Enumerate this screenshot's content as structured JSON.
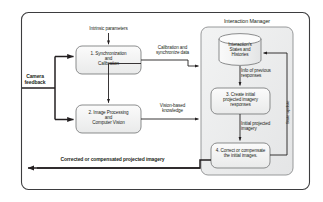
{
  "diagram": {
    "outer_frame": {
      "name": "system-boundary"
    },
    "panel": {
      "title": "Interaction Manager"
    },
    "nodes": [
      {
        "id": "node-1",
        "label": "1. Synchronization\nand\nCalibration",
        "shape": "rounded-rect"
      },
      {
        "id": "node-2",
        "label": "2. Image Processing\nand\nComputer Vision",
        "shape": "rounded-rect"
      },
      {
        "id": "node-datastore",
        "label": "Interaction's\nStates and\nHistories",
        "shape": "cylinder"
      },
      {
        "id": "node-3",
        "label": "3. Create initial\nprojected imagery\nresponses",
        "shape": "rounded-rect"
      },
      {
        "id": "node-4",
        "label": "4. Correct or compensate\nthe initial images.",
        "shape": "rounded-rect"
      }
    ],
    "edge_labels": [
      {
        "id": "edge-intrinsic",
        "text": "Intrinsic parameters"
      },
      {
        "id": "edge-camera-feedback",
        "text": "Camera\nfeedback",
        "bold": true
      },
      {
        "id": "edge-calibration",
        "text": "Calibration and\nsynchronize data"
      },
      {
        "id": "edge-vision",
        "text": "Vision-based\nknowledge"
      },
      {
        "id": "edge-info-previous",
        "text": "Info of previous\nresponses"
      },
      {
        "id": "edge-initial-projected",
        "text": "Initial projected\nimagery"
      },
      {
        "id": "edge-state-update",
        "text": "State update"
      },
      {
        "id": "edge-corrected",
        "text": "Corrected or compensated projected imagery",
        "bold": true
      }
    ],
    "colors": {
      "stroke": "#58595b",
      "text": "#231f20",
      "node_fill": "#f1f1f2",
      "panel_fill": "#eceded",
      "background": "#ffffff",
      "arrow": "#231f20"
    }
  }
}
